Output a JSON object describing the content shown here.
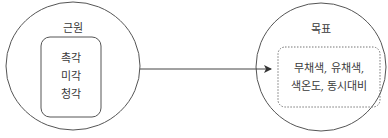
{
  "diagram": {
    "source": {
      "title": "근원",
      "items": [
        "촉각",
        "미각",
        "청각"
      ]
    },
    "target": {
      "title": "목표",
      "lines": [
        "무채색, 유채색,",
        "색온도, 동시대비"
      ]
    },
    "arrow": {
      "direction": "source-to-target"
    },
    "colors": {
      "stroke": "#555555",
      "text": "#3a3a3a",
      "background": "#ffffff"
    }
  }
}
